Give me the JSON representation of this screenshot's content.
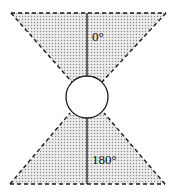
{
  "diagram": {
    "type": "angular-sector-diagram",
    "colors": {
      "stroke": "#1a1a1a",
      "fill_background": "#e4e4e4",
      "dot": "#8a8a8a",
      "circle_fill": "#ffffff"
    },
    "center_circle": {
      "cx": 87,
      "cy": 97,
      "r": 21
    },
    "sectors": [
      {
        "name": "top",
        "label": "0°",
        "base_y": 13,
        "base_x_left": 11,
        "base_x_right": 166,
        "apex_left": [
          72,
          82
        ],
        "apex_right": [
          102,
          82
        ]
      },
      {
        "name": "bottom",
        "label": "180°",
        "base_y": 184,
        "base_x_left": 10,
        "base_x_right": 165,
        "apex_left": [
          70,
          113
        ],
        "apex_right": [
          104,
          113
        ]
      }
    ],
    "labels": {
      "top": "0°",
      "bottom": "180°"
    }
  }
}
